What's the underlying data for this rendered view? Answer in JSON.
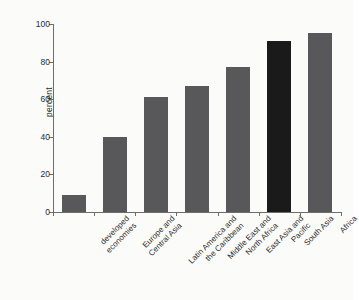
{
  "chart_data": {
    "type": "bar",
    "title": "",
    "subtitle": "",
    "xlabel": "",
    "ylabel": "percent",
    "ylim": [
      0,
      100
    ],
    "yticks": [
      0,
      20,
      40,
      60,
      80,
      100
    ],
    "grid": false,
    "legend": null,
    "categories": [
      "developed economies",
      "Europe and Central Asia",
      "Latin America and the Caribbean",
      "Middle East and North Africa",
      "East Asia and Pacific",
      "South Asia",
      "Africa"
    ],
    "category_lines": [
      [
        "developed",
        "economies"
      ],
      [
        "Europe and",
        "Central Asia"
      ],
      [
        "Latin America and",
        "the Caribbean"
      ],
      [
        "Middle East and",
        "North Africa"
      ],
      [
        "East Asia and",
        "Pacific"
      ],
      [
        "South Asia"
      ],
      [
        "Africa"
      ]
    ],
    "values": [
      9,
      40,
      61,
      67,
      77,
      91,
      95
    ],
    "bar_colors": [
      "#58585a",
      "#58585a",
      "#58585a",
      "#58585a",
      "#58585a",
      "#1a1a1a",
      "#58585a"
    ],
    "highlighted_category": "South Asia",
    "colors": {
      "bar": "#58585a",
      "bar_highlight": "#1a1a1a",
      "axis": "#6d6d6d",
      "text": "#2b2b2b",
      "background": "#fbfbfa"
    }
  }
}
